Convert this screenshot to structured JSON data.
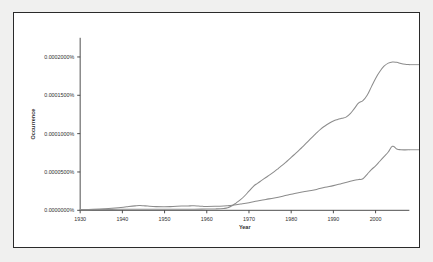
{
  "figure": {
    "background_color": "#f0f0ef",
    "panel_color": "#ffffff",
    "border_color": "#2a2a2a"
  },
  "chart_data": {
    "type": "line",
    "title": "",
    "xlabel": "Year",
    "ylabel": "Occurrence",
    "xlim": [
      1930,
      2008
    ],
    "ylim": [
      0,
      0.000225
    ],
    "grid": false,
    "legend_position": "right-inline-labels",
    "xticks": [
      1930,
      1940,
      1950,
      1960,
      1970,
      1980,
      1990,
      2000
    ],
    "xtick_labels": [
      "1930",
      "1940",
      "1950",
      "1960",
      "1970",
      "1980",
      "1990",
      "2000"
    ],
    "yticks": [
      0,
      5e-05,
      0.0001,
      0.00015,
      0.0002
    ],
    "ytick_labels": [
      "0.0000000%",
      "0.0000500%",
      "0.0001000%",
      "0.0001500%",
      "0.0002000%"
    ],
    "series": [
      {
        "name": "bullshit",
        "color": "#8c8c8c",
        "label": "bullshit",
        "x": [
          1930,
          1933,
          1936,
          1939,
          1942,
          1945,
          1948,
          1951,
          1954,
          1957,
          1960,
          1962,
          1964,
          1965,
          1966,
          1967,
          1968,
          1969,
          1970,
          1971,
          1972,
          1973,
          1974,
          1975,
          1976,
          1977,
          1978,
          1979,
          1980,
          1981,
          1982,
          1983,
          1984,
          1985,
          1986,
          1987,
          1988,
          1989,
          1990,
          1991,
          1992,
          1993,
          1994,
          1995,
          1996,
          1997,
          1998,
          1999,
          2000,
          2001,
          2002,
          2003,
          2004,
          2005,
          2006,
          2007,
          2008
        ],
        "values": [
          1e-06,
          1.1e-06,
          1.2e-06,
          1.3e-06,
          1.4e-06,
          1.4e-06,
          1.4e-06,
          1.4e-06,
          1.5e-06,
          1.5e-06,
          1.6e-06,
          1.8e-06,
          2.4e-06,
          3.4e-06,
          6e-06,
          9.8e-06,
          1.4e-05,
          1.9e-05,
          2.5e-05,
          3.1e-05,
          3.52e-05,
          3.9e-05,
          4.28e-05,
          4.65e-05,
          5.05e-05,
          5.48e-05,
          5.92e-05,
          6.4e-05,
          6.9e-05,
          7.4e-05,
          7.9e-05,
          8.45e-05,
          9e-05,
          9.55e-05,
          0.000101,
          0.000106,
          0.00011,
          0.0001135,
          0.0001165,
          0.0001185,
          0.00012,
          0.0001215,
          0.000126,
          0.000133,
          0.00014,
          0.000143,
          0.00015,
          0.000161,
          0.000172,
          0.000181,
          0.000188,
          0.000192,
          0.0001935,
          0.000193,
          0.0001915,
          0.0001905,
          0.00019
        ]
      },
      {
        "name": "zombie",
        "color": "#8c8c8c",
        "label": "zombie",
        "x": [
          1930,
          1933,
          1936,
          1939,
          1941,
          1943,
          1944,
          1945,
          1946,
          1948,
          1950,
          1952,
          1954,
          1956,
          1957,
          1958,
          1959,
          1960,
          1962,
          1964,
          1965,
          1966,
          1968,
          1970,
          1972,
          1974,
          1976,
          1978,
          1980,
          1982,
          1984,
          1986,
          1988,
          1990,
          1992,
          1994,
          1995,
          1996,
          1997,
          1998,
          1999,
          2000,
          2001,
          2002,
          2003,
          2004,
          2005,
          2006,
          2007,
          2008
        ],
        "values": [
          8e-07,
          1.2e-06,
          2e-06,
          3.3e-06,
          4.6e-06,
          5.8e-06,
          6.2e-06,
          6e-06,
          5.5e-06,
          4.8e-06,
          4.6e-06,
          5e-06,
          5.5e-06,
          5.8e-06,
          5.9e-06,
          5.6e-06,
          5.2e-06,
          5e-06,
          5.2e-06,
          5.6e-06,
          6e-06,
          6.6e-06,
          8.2e-06,
          1e-05,
          1.22e-05,
          1.42e-05,
          1.62e-05,
          1.84e-05,
          2.08e-05,
          2.32e-05,
          2.52e-05,
          2.72e-05,
          3e-05,
          3.22e-05,
          3.5e-05,
          3.78e-05,
          3.92e-05,
          4.02e-05,
          4.12e-05,
          4.7e-05,
          5.3e-05,
          5.8e-05,
          6.4e-05,
          7e-05,
          7.6e-05,
          8.35e-05,
          8e-05,
          7.9e-05,
          7.88e-05,
          7.9e-05
        ]
      }
    ]
  }
}
